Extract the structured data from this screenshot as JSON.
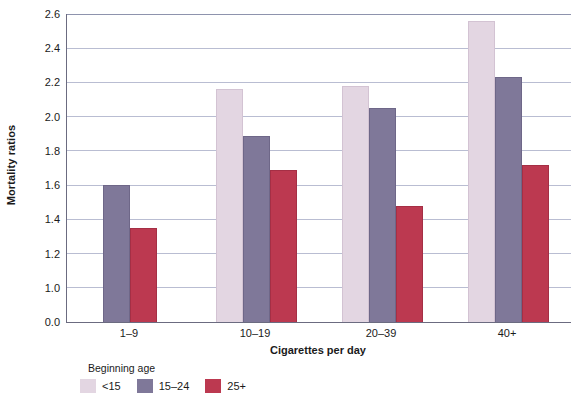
{
  "chart_data": {
    "type": "bar",
    "title": "",
    "xlabel": "Cigarettes per day",
    "ylabel": "Mortality ratios",
    "categories": [
      "1–9",
      "10–19",
      "20–39",
      "40+"
    ],
    "series": [
      {
        "name": "<15",
        "color": "#e3d6e2",
        "values": [
          null,
          2.16,
          2.18,
          2.56
        ]
      },
      {
        "name": "15–24",
        "color": "#7f7899",
        "values": [
          1.6,
          1.89,
          2.05,
          2.23
        ]
      },
      {
        "name": "25+",
        "color": "#bc3950",
        "values": [
          1.35,
          1.69,
          1.48,
          1.72
        ]
      }
    ],
    "ylim": [
      0.0,
      2.6
    ],
    "y_ticks": [
      "0.0",
      "1.0",
      "1.2",
      "1.4",
      "1.6",
      "1.8",
      "2.0",
      "2.2",
      "2.4",
      "2.6"
    ],
    "y_axis_broken": true,
    "grid": true,
    "legend_title": "Beginning age",
    "legend_position": "bottom-left"
  }
}
